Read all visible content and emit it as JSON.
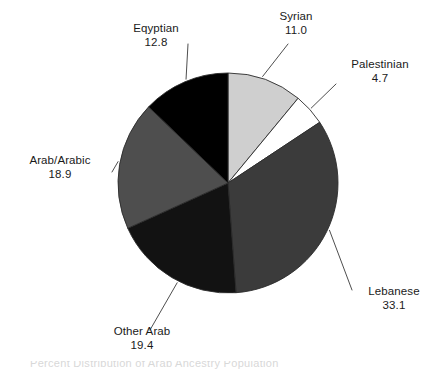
{
  "chart_data": {
    "type": "pie",
    "title": "",
    "subtitle": "",
    "xlabel": "",
    "ylabel": "",
    "legend_position": "none",
    "grid": false,
    "labels_outside": true,
    "total": 99.9,
    "units": "percent",
    "categories": [
      "Syrian",
      "Palestinian",
      "Lebanese",
      "Other Arab",
      "Arab/Arabic",
      "Eqyptian"
    ],
    "values": [
      11.0,
      4.7,
      33.1,
      19.4,
      18.9,
      12.8
    ],
    "value_strings": [
      "11.0",
      "4.7",
      "33.1",
      "19.4",
      "18.9",
      "12.8"
    ],
    "colors": [
      "#cfcfcf",
      "#ffffff",
      "#3b3b3b",
      "#121212",
      "#4e4e4e",
      "#000000"
    ],
    "slices": [
      {
        "name": "Syrian",
        "value": 11.0,
        "value_text": "11.0",
        "color": "#cfcfcf",
        "start_angle": 0.0,
        "end_angle": 39.6
      },
      {
        "name": "Palestinian",
        "value": 4.7,
        "value_text": "4.7",
        "color": "#ffffff",
        "start_angle": 39.6,
        "end_angle": 56.5
      },
      {
        "name": "Lebanese",
        "value": 33.1,
        "value_text": "33.1",
        "color": "#3b3b3b",
        "start_angle": 56.5,
        "end_angle": 175.8
      },
      {
        "name": "Other Arab",
        "value": 19.4,
        "value_text": "19.4",
        "color": "#121212",
        "start_angle": 175.8,
        "end_angle": 245.7
      },
      {
        "name": "Arab/Arabic",
        "value": 18.9,
        "value_text": "18.9",
        "color": "#4e4e4e",
        "start_angle": 245.7,
        "end_angle": 313.8
      },
      {
        "name": "Eqyptian",
        "value": 12.8,
        "value_text": "12.8",
        "color": "#000000",
        "start_angle": 313.8,
        "end_angle": 360.0
      }
    ]
  },
  "geometry": {
    "center_x": 228,
    "center_y": 183,
    "radius": 110
  },
  "caption": {
    "text": "Percent Distribution of Arab Ancestry Population"
  },
  "style": {
    "background": "#ffffff",
    "text_color": "#1a1a1a",
    "outline_color": "#2b2b2b",
    "leader_color": "#3a3a3a"
  }
}
